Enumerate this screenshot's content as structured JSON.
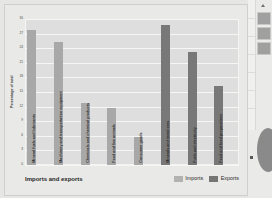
{
  "chart_data": {
    "type": "bar",
    "title": "",
    "xlabel": "Imports and exports",
    "ylabel": "Percentage of total",
    "ylim": [
      0,
      30
    ],
    "ytick_labels": [
      "30",
      "27",
      "24",
      "21",
      "18",
      "15",
      "12",
      "9",
      "6",
      "3",
      "0"
    ],
    "grid": true,
    "legend_position": "bottom-right",
    "categories": [
      "Mineral fuels and lubricants",
      "Machinery and transportation equipment",
      "Chemicals and chemical products",
      "Food and live animals",
      "Consumer goods",
      "Minerals and metal ores",
      "Fuels and electricity",
      "Food and food preparations"
    ],
    "series": [
      {
        "name": "Imports",
        "color": "#a8a8a8",
        "values": [
          27.8,
          25.2,
          12.8,
          11.8,
          5.8,
          null,
          null,
          null
        ]
      },
      {
        "name": "Exports",
        "color": "#787878",
        "values": [
          null,
          null,
          null,
          null,
          null,
          28.8,
          23.2,
          16.2
        ]
      }
    ],
    "bars": [
      {
        "category": "Mineral fuels and lubricants",
        "value": 27.8,
        "series": "Imports"
      },
      {
        "category": "Machinery and transportation equipment",
        "value": 25.2,
        "series": "Imports"
      },
      {
        "category": "Chemicals and chemical products",
        "value": 12.8,
        "series": "Imports"
      },
      {
        "category": "Food and live animals",
        "value": 11.8,
        "series": "Imports"
      },
      {
        "category": "Consumer goods",
        "value": 5.8,
        "series": "Imports"
      },
      {
        "category": "Minerals and metal ores",
        "value": 28.8,
        "series": "Exports"
      },
      {
        "category": "Fuels and electricity",
        "value": 23.2,
        "series": "Exports"
      },
      {
        "category": "Food and food preparations",
        "value": 16.2,
        "series": "Exports"
      }
    ]
  },
  "legend": {
    "imports_label": "Imports",
    "exports_label": "Exports"
  },
  "axis": {
    "x_title": "Imports and exports",
    "y_title": "Percentage of total"
  },
  "colors": {
    "imports": "#a8a8a8",
    "exports": "#787878",
    "plot_background": "#dedede",
    "page_background": "#e6e6e4",
    "gridline": "#f6f6f4"
  },
  "right_panel": {
    "items": [
      "panel-swatch-1",
      "panel-swatch-2",
      "panel-swatch-3"
    ]
  }
}
